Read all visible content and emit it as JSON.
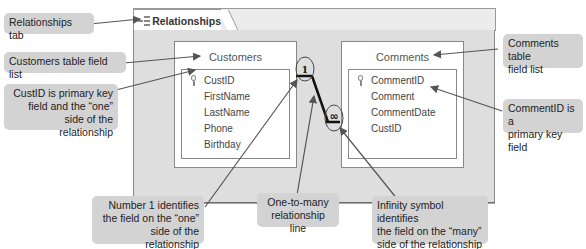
{
  "caption": "FIGURE 9: Relating the Customers and Comments tables",
  "window": {
    "tab_label": "Relationships",
    "tab_icon": "relationships-icon"
  },
  "tables": [
    {
      "name": "Customers",
      "fields": [
        "CustID",
        "FirstName",
        "LastName",
        "Phone",
        "Birthday"
      ],
      "primary_key": "CustID"
    },
    {
      "name": "Comments",
      "fields": [
        "CommentID",
        "Comment",
        "CommentDate",
        "CustID"
      ],
      "primary_key": "CommentID"
    }
  ],
  "relationship": {
    "one_symbol": "1",
    "many_symbol": "∞"
  },
  "callouts": {
    "relationships_tab": "Relationships tab",
    "customers_field_list": "Customers table field list",
    "custid_pk": [
      "CustID is primary key",
      "field and the “one”",
      "side of the relationship"
    ],
    "comments_field_list": [
      "Comments table",
      "field list"
    ],
    "commentid_pk": [
      "CommentID is a",
      "primary key field"
    ],
    "number_one": [
      "Number 1 identifies",
      "the field on the “one”",
      "side of the relationship"
    ],
    "one_to_many": [
      "One-to-many",
      "relationship line"
    ],
    "infinity": [
      "Infinity symbol identifies",
      "the field on the “many”",
      "side of the relationship"
    ]
  }
}
